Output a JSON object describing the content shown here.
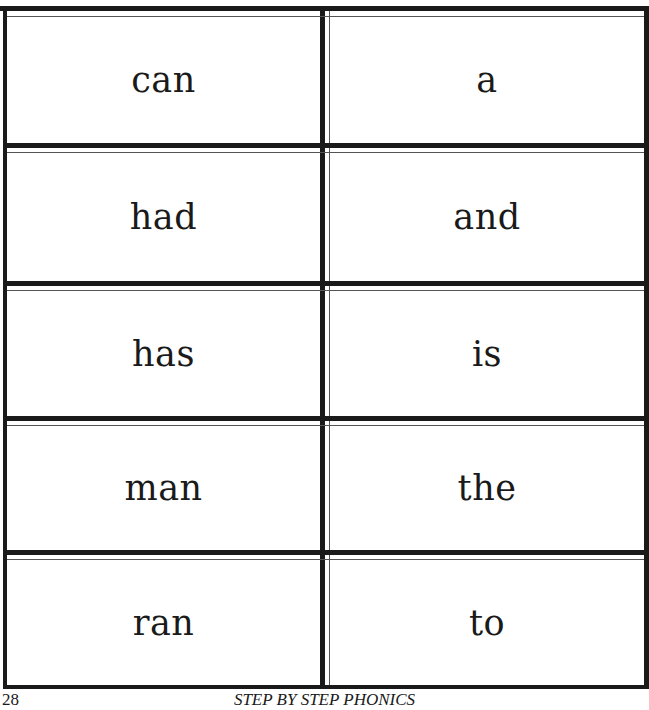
{
  "flashcards": {
    "rows": [
      {
        "left": "can",
        "right": "a"
      },
      {
        "left": "had",
        "right": "and"
      },
      {
        "left": "has",
        "right": "is"
      },
      {
        "left": "man",
        "right": "the"
      },
      {
        "left": "ran",
        "right": "to"
      }
    ]
  },
  "footer": {
    "page_number": "28",
    "book_title": "STEP BY STEP PHONICS"
  }
}
